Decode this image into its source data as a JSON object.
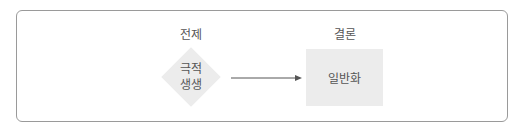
{
  "diagram": {
    "premise": {
      "heading": "전제",
      "shape": "diamond",
      "line1": "극적",
      "line2": "생생",
      "fill": "#ececec"
    },
    "conclusion": {
      "heading": "결론",
      "shape": "square",
      "text": "일반화",
      "fill": "#ececec"
    },
    "connector": {
      "type": "arrow",
      "from": "premise",
      "to": "conclusion",
      "color": "#555555"
    },
    "frame": {
      "border_color": "#9a9a9a"
    }
  }
}
